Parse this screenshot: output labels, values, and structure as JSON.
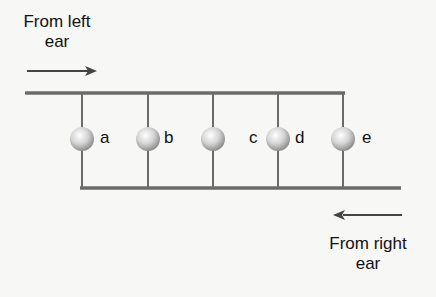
{
  "labels": {
    "left_ear_line1": "From left",
    "left_ear_line2": "ear",
    "right_ear_line1": "From right",
    "right_ear_line2": "ear"
  },
  "detectors": [
    {
      "id": "a",
      "label": "a"
    },
    {
      "id": "b",
      "label": "b"
    },
    {
      "id": "c",
      "label": "c"
    },
    {
      "id": "d",
      "label": "d"
    },
    {
      "id": "e",
      "label": "e"
    }
  ],
  "colors": {
    "line": "#6b6b6b",
    "arrow": "#444444",
    "ball_light": "#ffffff",
    "ball_dark": "#9a9a9a"
  }
}
